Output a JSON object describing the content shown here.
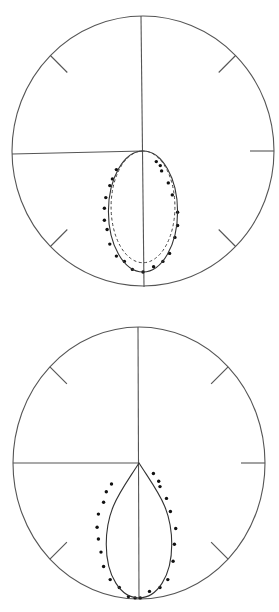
{
  "chart_data": [
    {
      "type": "scatter",
      "subtype": "polar",
      "title": "",
      "position": "top",
      "axes": {
        "radial_range": [
          0,
          1
        ],
        "tick_angles_deg": [
          0,
          45,
          90,
          135,
          180,
          225,
          270,
          315
        ],
        "grid": false
      },
      "colors": {
        "frame": "#555555",
        "points": "#111111",
        "curves": "#333333"
      },
      "series": [
        {
          "name": "measured",
          "kind": "points",
          "x": [
            -0.2,
            -0.23,
            -0.25,
            -0.28,
            -0.29,
            -0.29,
            -0.27,
            -0.25,
            -0.2,
            -0.14,
            -0.08,
            0.0,
            0.08,
            0.15,
            0.2,
            0.24,
            0.26,
            0.26,
            0.22,
            0.19,
            0.14,
            0.13,
            0.1
          ],
          "y": [
            -0.14,
            -0.21,
            -0.26,
            -0.35,
            -0.43,
            -0.52,
            -0.59,
            -0.7,
            -0.79,
            -0.83,
            -0.89,
            -0.91,
            -0.87,
            -0.83,
            -0.77,
            -0.65,
            -0.56,
            -0.46,
            -0.33,
            -0.24,
            -0.15,
            -0.11,
            -0.08
          ]
        },
        {
          "name": "theory-solid",
          "kind": "ellipse",
          "style": "solid",
          "center": [
            0.0,
            -0.455
          ],
          "semi_axes": [
            0.26,
            0.455
          ]
        },
        {
          "name": "theory-dashed",
          "kind": "ellipse",
          "style": "dashed",
          "center": [
            0.0,
            -0.42
          ],
          "semi_axes": [
            0.24,
            0.42
          ]
        }
      ]
    },
    {
      "type": "scatter",
      "subtype": "polar",
      "title": "",
      "position": "bottom",
      "axes": {
        "radial_range": [
          0,
          1
        ],
        "tick_angles_deg": [
          0,
          45,
          90,
          135,
          180,
          225,
          270,
          315
        ],
        "grid": false
      },
      "colors": {
        "frame": "#555555",
        "points": "#111111",
        "curves": "#333333"
      },
      "series": [
        {
          "name": "measured",
          "kind": "points",
          "x": [
            -0.21,
            -0.25,
            -0.27,
            -0.31,
            -0.32,
            -0.31,
            -0.29,
            -0.27,
            -0.22,
            -0.15,
            -0.08,
            -0.03,
            0.11,
            0.15,
            0.16,
            0.21,
            0.24,
            0.28,
            0.27,
            0.26,
            0.22,
            0.16,
            0.08,
            0.01
          ],
          "y": [
            -0.16,
            -0.22,
            -0.3,
            -0.39,
            -0.49,
            -0.58,
            -0.68,
            -0.79,
            -0.89,
            -0.95,
            -1.02,
            -1.03,
            -0.08,
            -0.14,
            -0.18,
            -0.27,
            -0.37,
            -0.5,
            -0.62,
            -0.75,
            -0.89,
            -0.95,
            -0.98,
            -1.03
          ]
        },
        {
          "name": "theory-solid",
          "kind": "teardrop",
          "style": "solid",
          "tip": [
            0.0,
            0.0
          ],
          "bottom": [
            0.0,
            -1.03
          ],
          "max_half_width": 0.25,
          "max_width_at_y": -0.62
        }
      ]
    }
  ]
}
